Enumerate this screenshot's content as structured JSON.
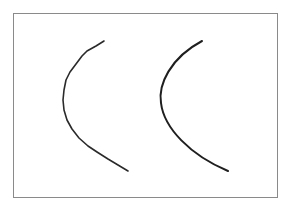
{
  "figure": {
    "frame": {
      "x": 13,
      "y": 13,
      "width": 265,
      "height": 185,
      "stroke": "#8a8a8a"
    },
    "curves": [
      {
        "name": "left-curve",
        "style": "hand-drawn, slightly wobbly",
        "stroke": "#2a2a2a",
        "stroke_width": 1.6,
        "points": [
          [
            104,
            41
          ],
          [
            96,
            46
          ],
          [
            87,
            51
          ],
          [
            82,
            56
          ],
          [
            76,
            64
          ],
          [
            70,
            72
          ],
          [
            66,
            80
          ],
          [
            64,
            90
          ],
          [
            63,
            100
          ],
          [
            64,
            110
          ],
          [
            67,
            120
          ],
          [
            72,
            129
          ],
          [
            79,
            138
          ],
          [
            88,
            146
          ],
          [
            97,
            152
          ],
          [
            108,
            159
          ],
          [
            118,
            165
          ],
          [
            128,
            171
          ]
        ]
      },
      {
        "name": "right-curve",
        "style": "smooth arc",
        "stroke": "#1f1f1f",
        "stroke_width": 2.0,
        "path": "M202,41 C170,58 158,85 161,103 C164,128 190,155 228,171"
      }
    ]
  }
}
